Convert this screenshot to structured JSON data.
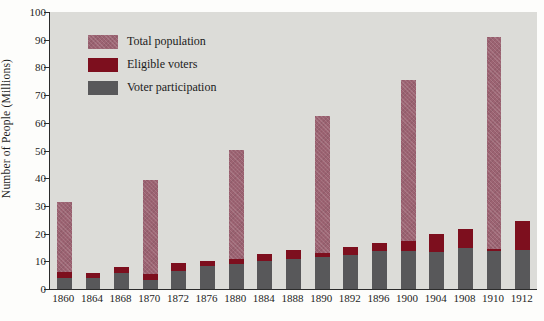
{
  "chart_data": {
    "type": "bar",
    "stacked": true,
    "title": "",
    "xlabel": "",
    "ylabel": "Number of People (Millions)",
    "ylim": [
      0,
      100
    ],
    "yticks": [
      0,
      10,
      20,
      30,
      40,
      50,
      60,
      70,
      80,
      90,
      100
    ],
    "grid": false,
    "legend_position": "upper-left-inside",
    "categories": [
      "1860",
      "1864",
      "1868",
      "1870",
      "1872",
      "1876",
      "1880",
      "1884",
      "1888",
      "1890",
      "1892",
      "1896",
      "1900",
      "1904",
      "1908",
      "1910",
      "1912"
    ],
    "series": [
      {
        "name": "Total population",
        "color": "#9c6372",
        "values": [
          31.5,
          5.8,
          7.8,
          39.5,
          9.3,
          10.2,
          50.2,
          12.8,
          14.2,
          62.5,
          15.2,
          16.5,
          75.5,
          20.0,
          21.8,
          91.0,
          24.5
        ]
      },
      {
        "name": "Eligible voters",
        "color": "#7d0f1e",
        "values": [
          6.2,
          5.8,
          7.8,
          5.5,
          9.3,
          10.2,
          11.0,
          12.8,
          14.2,
          13.0,
          15.2,
          16.5,
          17.2,
          20.0,
          21.8,
          14.5,
          24.5
        ]
      },
      {
        "name": "Voter participation",
        "color": "#58585a",
        "values": [
          4.0,
          4.0,
          5.7,
          3.1,
          6.5,
          8.3,
          9.2,
          10.0,
          11.0,
          11.5,
          12.1,
          13.6,
          13.8,
          13.5,
          14.8,
          13.8,
          14.0
        ]
      }
    ],
    "colors": {
      "total_population": "#9c6372",
      "eligible_voters": "#7d0f1e",
      "voter_participation": "#58585a",
      "plot_background": "#dcdcd8",
      "page_background": "#fdfdfb",
      "axis": "#2b2b2b"
    }
  },
  "legend": {
    "items": [
      {
        "label": "Total population",
        "swatch_name": "legend-swatch-total-population"
      },
      {
        "label": "Eligible voters",
        "swatch_name": "legend-swatch-eligible-voters"
      },
      {
        "label": "Voter participation",
        "swatch_name": "legend-swatch-voter-participation"
      }
    ]
  },
  "axes": {
    "y_title": "Number of People (Millions)",
    "y_tick_labels": [
      "100",
      "90",
      "80",
      "70",
      "60",
      "50",
      "40",
      "30",
      "20",
      "10",
      "0"
    ],
    "x_tick_labels": [
      "1860",
      "1864",
      "1868",
      "1870",
      "1872",
      "1876",
      "1880",
      "1884",
      "1888",
      "1890",
      "1892",
      "1896",
      "1900",
      "1904",
      "1908",
      "1910",
      "1912"
    ]
  }
}
